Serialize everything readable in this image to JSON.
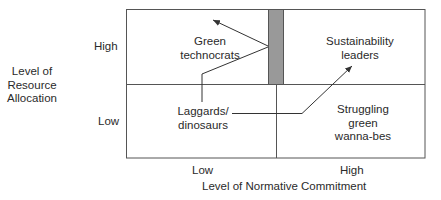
{
  "y_axis": {
    "title_lines": [
      "Level of",
      "Resource",
      "Allocation"
    ],
    "ticks": {
      "high": "High",
      "low": "Low"
    }
  },
  "x_axis": {
    "title": "Level of Normative Commitment",
    "ticks": {
      "low": "Low",
      "high": "High"
    }
  },
  "quadrants": {
    "top_left": {
      "lines": [
        "Green",
        "technocrats"
      ]
    },
    "top_right": {
      "lines": [
        "Sustainability",
        "leaders"
      ]
    },
    "bottom_left": {
      "lines": [
        "Laggards/",
        "dinosaurs"
      ]
    },
    "bottom_right": {
      "lines": [
        "Struggling",
        "green",
        "wanna-bes"
      ]
    }
  },
  "colors": {
    "line": "#555555",
    "bar": "#999999",
    "text": "#2a2a2a"
  }
}
